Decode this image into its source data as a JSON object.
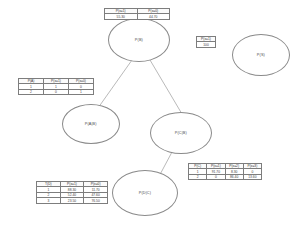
{
  "diagram": {
    "nodes": [
      {
        "id": "root",
        "label": "P(B)",
        "x": 108,
        "y": 18,
        "w": 62,
        "h": 44
      },
      {
        "id": "isolated",
        "label": "P(S)",
        "x": 232,
        "y": 34,
        "w": 58,
        "h": 42
      },
      {
        "id": "left",
        "label": "P(A|B)",
        "x": 62,
        "y": 104,
        "w": 58,
        "h": 40
      },
      {
        "id": "right",
        "label": "P(C|B)",
        "x": 150,
        "y": 112,
        "w": 62,
        "h": 42
      },
      {
        "id": "bottom",
        "label": "P(D|C)",
        "x": 112,
        "y": 170,
        "w": 66,
        "h": 46
      }
    ],
    "edges": [
      {
        "from": "root",
        "to": "left",
        "x1": 132,
        "y1": 60,
        "x2": 98,
        "y2": 108
      },
      {
        "from": "root",
        "to": "right",
        "x1": 150,
        "y1": 60,
        "x2": 182,
        "y2": 114
      },
      {
        "from": "right",
        "to": "bottom",
        "x1": 172,
        "y1": 152,
        "x2": 156,
        "y2": 182
      }
    ],
    "tables": [
      {
        "id": "cpt-root",
        "x": 104,
        "y": 8,
        "w": 66,
        "headers": [
          "P(x=1)",
          "P(x=0)"
        ],
        "rows": [
          [
            "55.30",
            "44.70"
          ]
        ]
      },
      {
        "id": "cpt-small",
        "x": 196,
        "y": 36,
        "w": 20,
        "headers": [
          "P(x=1)"
        ],
        "rows": [
          [
            "100"
          ]
        ]
      },
      {
        "id": "cpt-left",
        "x": 18,
        "y": 78,
        "w": 76,
        "headers": [
          "P(A)",
          "P(x=1)",
          "P(x=0)"
        ],
        "rows": [
          [
            "1",
            "1",
            "0"
          ],
          [
            "2",
            "0",
            "1"
          ]
        ]
      },
      {
        "id": "cpt-bottom-left",
        "x": 36,
        "y": 181,
        "w": 72,
        "headers": [
          "T(D)",
          "P(x=1)",
          "P(x=0)"
        ],
        "rows": [
          [
            "1",
            "88.30",
            "11.70"
          ],
          [
            "2",
            "52.40",
            "47.60"
          ],
          [
            "3",
            "23.50",
            "76.50"
          ]
        ]
      },
      {
        "id": "cpt-bottom-right",
        "x": 188,
        "y": 163,
        "w": 74,
        "headers": [
          "P(C)",
          "P(x=1)",
          "P(x=2)",
          "P(x=3)"
        ],
        "rows": [
          [
            "1",
            "91.70",
            "8.30",
            "0"
          ],
          [
            "2",
            "0",
            "86.40",
            "13.60"
          ]
        ]
      }
    ]
  }
}
